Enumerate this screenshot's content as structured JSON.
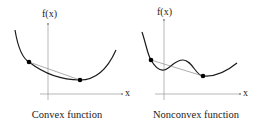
{
  "panels": [
    {
      "id": "convex",
      "caption": "Convex function",
      "y_axis_label": "f(x)",
      "x_axis_label": "x"
    },
    {
      "id": "nonconvex",
      "caption": "Nonconvex function",
      "y_axis_label": "f(x)",
      "x_axis_label": "x"
    }
  ],
  "colors": {
    "curve": "#1a1a1a",
    "axis": "#9a9a9a",
    "chord": "#8a8a8a",
    "point": "#000000"
  }
}
